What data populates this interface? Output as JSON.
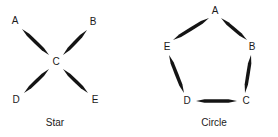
{
  "figure": {
    "width": 278,
    "height": 137,
    "background_color": "#ffffff",
    "ink_color": "#141414",
    "text_color": "#1a1a1a"
  },
  "panels": [
    {
      "id": "star",
      "caption": "Star",
      "caption_pos": {
        "x": 55,
        "y": 117
      },
      "nodes": [
        {
          "id": "A",
          "label": "A",
          "x": 15,
          "y": 21
        },
        {
          "id": "B",
          "label": "B",
          "x": 93,
          "y": 22
        },
        {
          "id": "C",
          "label": "C",
          "x": 56,
          "y": 62
        },
        {
          "id": "D",
          "label": "D",
          "x": 16,
          "y": 100
        },
        {
          "id": "E",
          "label": "E",
          "x": 95,
          "y": 100
        }
      ],
      "edges": [
        {
          "from": "A",
          "to": "C",
          "heads": "both",
          "x1": 22,
          "y1": 29,
          "x2": 49,
          "y2": 55
        },
        {
          "from": "B",
          "to": "C",
          "heads": "both",
          "x1": 87,
          "y1": 30,
          "x2": 63,
          "y2": 55
        },
        {
          "from": "D",
          "to": "C",
          "heads": "both",
          "x1": 24,
          "y1": 93,
          "x2": 49,
          "y2": 69
        },
        {
          "from": "E",
          "to": "C",
          "heads": "both",
          "x1": 88,
          "y1": 93,
          "x2": 63,
          "y2": 69
        }
      ]
    },
    {
      "id": "circle",
      "caption": "Circle",
      "caption_pos": {
        "x": 75,
        "y": 117
      },
      "nodes": [
        {
          "id": "A",
          "label": "A",
          "x": 76,
          "y": 11
        },
        {
          "id": "B",
          "label": "B",
          "x": 113,
          "y": 47
        },
        {
          "id": "C",
          "label": "C",
          "x": 107,
          "y": 101
        },
        {
          "id": "D",
          "label": "D",
          "x": 48,
          "y": 101
        },
        {
          "id": "E",
          "label": "E",
          "x": 28,
          "y": 47
        }
      ],
      "edges": [
        {
          "from": "A",
          "to": "E",
          "heads": "both",
          "x1": 70,
          "y1": 18,
          "x2": 34,
          "y2": 40
        },
        {
          "from": "A",
          "to": "B",
          "heads": "both",
          "x1": 82,
          "y1": 18,
          "x2": 108,
          "y2": 40
        },
        {
          "from": "E",
          "to": "D",
          "heads": "both",
          "x1": 30,
          "y1": 55,
          "x2": 45,
          "y2": 93
        },
        {
          "from": "B",
          "to": "C",
          "heads": "both",
          "x1": 112,
          "y1": 55,
          "x2": 106,
          "y2": 93
        },
        {
          "from": "D",
          "to": "C",
          "heads": "both",
          "x1": 57,
          "y1": 101,
          "x2": 98,
          "y2": 101
        }
      ]
    }
  ]
}
